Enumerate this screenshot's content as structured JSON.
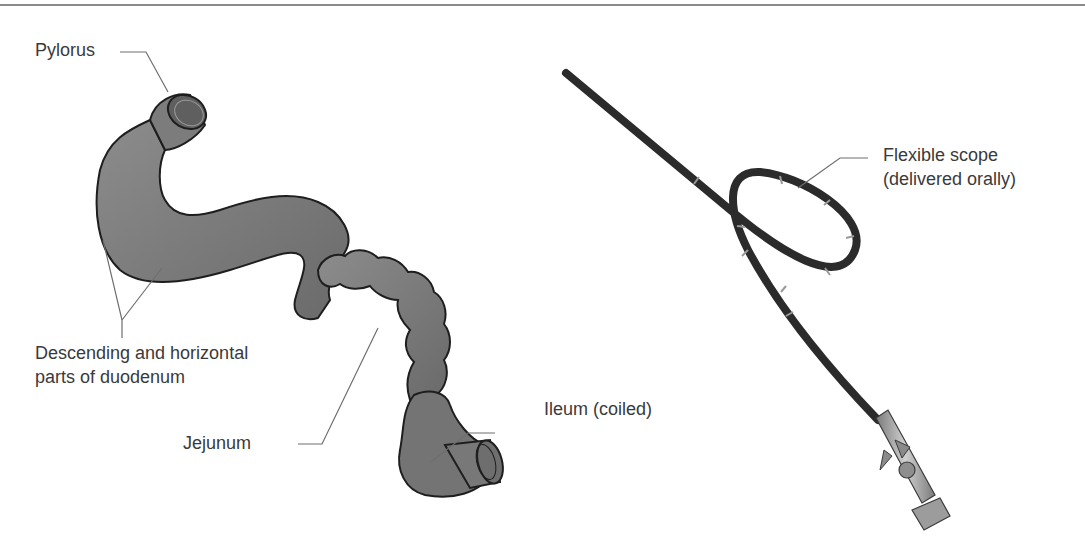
{
  "figure": {
    "colors": {
      "organ_fill": "#7a7a7a",
      "organ_outline": "#1e1e1e",
      "scope_body": "#2b2b2b",
      "scope_band": "#9a9a9a",
      "handle_fill": "#a8a8a8",
      "leader_line": "#6e6e6e",
      "label_text": "#3a3a3a",
      "rule": "#8a8a8a"
    },
    "left_panel": {
      "labels": {
        "pylorus": "Pylorus",
        "duodenum_line1": "Descending and horizontal",
        "duodenum_line2": "parts of duodenum",
        "jejunum": "Jejunum",
        "ileum": "Ileum (coiled)"
      }
    },
    "right_panel": {
      "labels": {
        "scope_line1": "Flexible scope",
        "scope_line2": "(delivered orally)"
      }
    }
  }
}
